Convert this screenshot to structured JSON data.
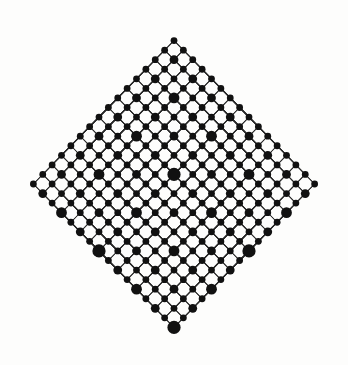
{
  "figure": {
    "type": "graph-diagram",
    "background_color": "#fdfdfc",
    "edge_color": "#2b2b2b",
    "node_color": "#111111",
    "canvas": {
      "width": 348,
      "height": 365
    }
  },
  "chart_data": {
    "type": "scatter",
    "xlabel": "",
    "ylabel": "",
    "xlim": [
      0,
      348
    ],
    "ylim": [
      0,
      365
    ],
    "grid": false,
    "legend": "none",
    "center": {
      "x": 174,
      "y": 184
    },
    "dimensions": 8,
    "vertex_count": 256,
    "edge_count": 1024,
    "generators": [
      {
        "name": "g1",
        "dx": 75.0,
        "dy": -76.5,
        "node_radius": 6.6
      },
      {
        "name": "g2",
        "dx": -75.0,
        "dy": -76.5,
        "node_radius": 6.6
      },
      {
        "name": "g3",
        "dx": 37.5,
        "dy": -38.25,
        "node_radius": 5.0
      },
      {
        "name": "g4",
        "dx": -37.5,
        "dy": -38.25,
        "node_radius": 5.0
      },
      {
        "name": "g5",
        "dx": 18.75,
        "dy": -19.12,
        "node_radius": 3.6
      },
      {
        "name": "g6",
        "dx": -18.75,
        "dy": -19.12,
        "node_radius": 3.6
      },
      {
        "name": "g7",
        "dx": 9.37,
        "dy": -9.56,
        "node_radius": 2.4
      },
      {
        "name": "g8",
        "dx": -9.37,
        "dy": -9.56,
        "node_radius": 2.4
      }
    ],
    "extreme_vertices": [
      {
        "label": "top",
        "x": 175,
        "y": 31
      },
      {
        "label": "left",
        "x": 24,
        "y": 184
      },
      {
        "label": "right",
        "x": 324,
        "y": 184
      },
      {
        "label": "bottom",
        "x": 175,
        "y": 337
      }
    ],
    "node_radius_by_depth": [
      6.6,
      5.4,
      4.4,
      3.4,
      2.6,
      2.0,
      1.6,
      1.3
    ],
    "edge_width_by_depth": [
      1.05,
      0.95,
      0.85,
      0.75,
      0.65,
      0.6,
      0.55,
      0.5
    ]
  }
}
